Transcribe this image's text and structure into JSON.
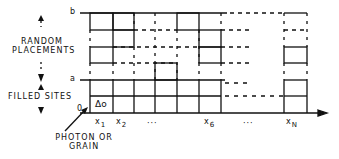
{
  "diagram": {
    "labels": {
      "random_placements_line1": "RANDOM",
      "random_placements_line2": "PLACEMENTS",
      "filled_sites": "FILLED SITES",
      "origin": "0",
      "level_a": "a",
      "level_b": "b",
      "photon_line1": "PHOTON OR",
      "photon_line2": "GRAIN",
      "photon_symbol": "Δo"
    },
    "x_ticks": [
      {
        "base": "x",
        "sub": "1"
      },
      {
        "base": "x",
        "sub": "2"
      },
      {
        "base": "···",
        "sub": ""
      },
      {
        "base": "x",
        "sub": "6"
      },
      {
        "base": "···",
        "sub": ""
      },
      {
        "base": "x",
        "sub": "N"
      }
    ],
    "colors": {
      "line": "#111111",
      "background": "#ffffff"
    }
  }
}
